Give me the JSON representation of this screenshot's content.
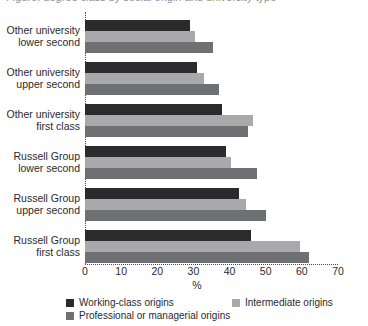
{
  "figure": {
    "cut_off_title": "Figure: degree class by social origin and university type",
    "xaxis_title": "%"
  },
  "chart_data": {
    "type": "bar",
    "orientation": "horizontal",
    "title": "",
    "xlabel": "%",
    "ylabel": "",
    "xlim": [
      0,
      70
    ],
    "xticks": [
      0,
      10,
      20,
      30,
      40,
      50,
      60,
      70
    ],
    "grid": false,
    "legend_position": "bottom",
    "categories": [
      "Other university lower second",
      "Other university upper second",
      "Other university first class",
      "Russell Group lower second",
      "Russell Group upper second",
      "Russell Group first class"
    ],
    "category_lines": [
      [
        "Other university",
        "lower second"
      ],
      [
        "Other university",
        "upper second"
      ],
      [
        "Other university",
        "first class"
      ],
      [
        "Russell Group",
        "lower second"
      ],
      [
        "Russell Group",
        "upper second"
      ],
      [
        "Russell Group",
        "first class"
      ]
    ],
    "series": [
      {
        "name": "Working-class origins",
        "color": "#2b2b2e",
        "values": [
          29,
          31,
          38,
          39,
          42.5,
          46
        ]
      },
      {
        "name": "Intermediate origins",
        "color": "#a9a9ab",
        "values": [
          30.5,
          33,
          46.5,
          40.5,
          44.5,
          59.5
        ]
      },
      {
        "name": "Professional or managerial origins",
        "color": "#6f7073",
        "values": [
          35.5,
          37,
          45,
          47.5,
          50,
          62
        ]
      }
    ]
  },
  "legend": {
    "items": [
      {
        "label": "Working-class origins",
        "color": "#2b2b2e"
      },
      {
        "label": "Intermediate origins",
        "color": "#a9a9ab"
      },
      {
        "label": "Professional or managerial origins",
        "color": "#6f7073"
      }
    ]
  }
}
